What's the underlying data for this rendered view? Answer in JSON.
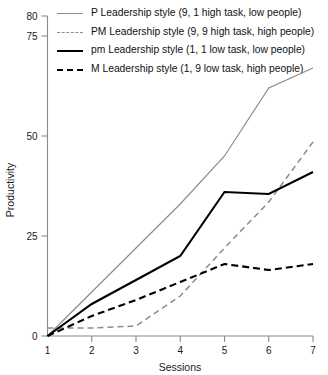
{
  "chart_data": {
    "type": "line",
    "title": "",
    "xlabel": "Sessions",
    "ylabel": "Productivity",
    "x": [
      1,
      2,
      3,
      4,
      5,
      6,
      7
    ],
    "xlim": [
      1,
      7
    ],
    "ylim": [
      0,
      80
    ],
    "xticks": [
      "1",
      "2",
      "3",
      "4",
      "5",
      "6",
      "7"
    ],
    "yticks": [
      "0",
      "25",
      "50",
      "75",
      "80"
    ],
    "ytick_values": [
      0,
      25,
      50,
      75,
      80
    ],
    "grid": false,
    "legend_position": "top-left",
    "series": [
      {
        "name": "P Leadership style (9, 1 high task, low people)",
        "style": "solid",
        "color": "#8c8c8c",
        "width": "thin",
        "values": [
          0,
          11,
          22,
          33,
          45,
          62,
          67
        ]
      },
      {
        "name": "PM Leadership style (9, 9 high task, high people)",
        "style": "dashed",
        "color": "#8c8c8c",
        "width": "thin",
        "values": [
          2,
          2,
          2.5,
          10,
          22,
          33.5,
          48.5
        ]
      },
      {
        "name": "pm Leadership style (1, 1 low task, low people)",
        "style": "solid",
        "color": "#000000",
        "width": "thick",
        "values": [
          0,
          8,
          14,
          20,
          36,
          35.5,
          41
        ]
      },
      {
        "name": "M Leadership style (1, 9 low task, high people)",
        "style": "dashed",
        "color": "#000000",
        "width": "thick",
        "values": [
          0,
          5,
          9,
          13.5,
          18,
          16.5,
          18
        ]
      }
    ]
  },
  "legend": {
    "items": [
      {
        "label": "P Leadership style (9, 1 high task, low people)"
      },
      {
        "label": "PM Leadership style (9, 9 high task, high people)"
      },
      {
        "label": "pm Leadership style (1, 1 low task, low people)"
      },
      {
        "label": "M Leadership style (1, 9 low task, high people)"
      }
    ]
  },
  "axes": {
    "y_title": "Productivity",
    "x_title": "Sessions",
    "y_tick_labels": [
      "80",
      "75",
      "50",
      "25",
      "0"
    ],
    "x_tick_labels": [
      "1",
      "2",
      "3",
      "4",
      "5",
      "6",
      "7"
    ]
  },
  "colors": {
    "gray_series": "#8c8c8c",
    "black_series": "#000000",
    "axis": "#8a8a8a",
    "text": "#1a1a1a",
    "background": "#ffffff"
  }
}
